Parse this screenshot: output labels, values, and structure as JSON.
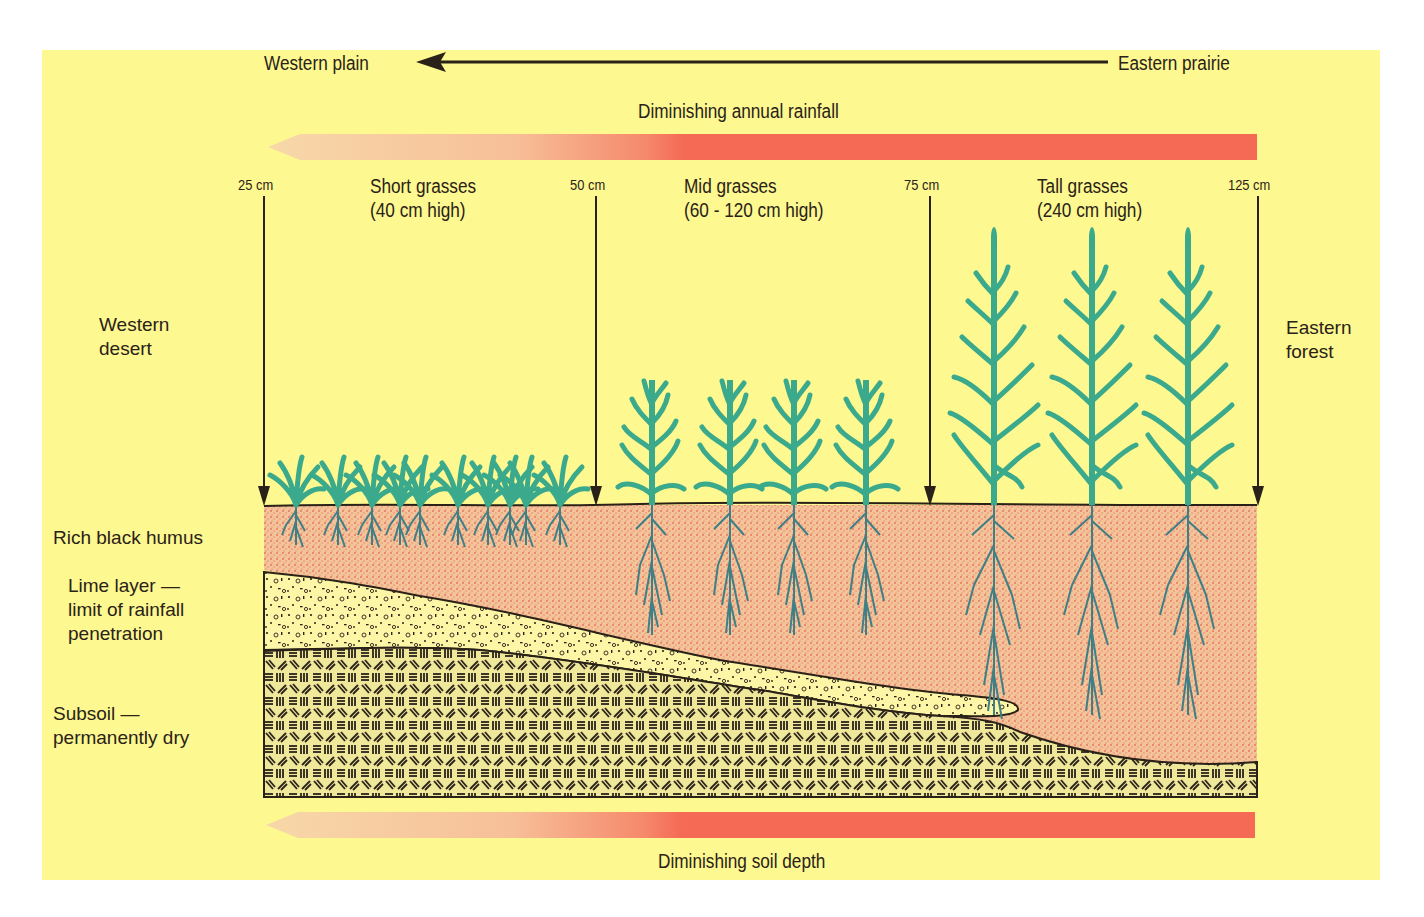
{
  "diagram": {
    "direction_arrow": {
      "left_label": "Western plain",
      "right_label": "Eastern prairie",
      "icon": "arrow-left-icon"
    },
    "rainfall_bar": {
      "label": "Diminishing annual rainfall",
      "color_full": "#f56a55",
      "color_faded": "#f7c9a0"
    },
    "soil_depth_bar": {
      "label": "Diminishing soil depth",
      "color_full": "#f56a55",
      "color_faded": "#f7c9a0"
    },
    "rainfall_markers": [
      {
        "label": "25 cm"
      },
      {
        "label": "50 cm"
      },
      {
        "label": "75 cm"
      },
      {
        "label": "125 cm"
      }
    ],
    "grass_zones": [
      {
        "name": "Short grasses",
        "height": "(40 cm high)"
      },
      {
        "name": "Mid grasses",
        "height": "(60 - 120 cm high)"
      },
      {
        "name": "Tall grasses",
        "height": "(240 cm high)"
      }
    ],
    "side_labels": {
      "west": "Western\ndesert",
      "east": "Eastern\nforest"
    },
    "soil_layers": [
      {
        "label": "Rich black humus",
        "color": "#f2b088"
      },
      {
        "label": "Lime layer —\nlimit of rainfall\npenetration",
        "color": "#fdf6a6"
      },
      {
        "label": "Subsoil —\npermanently dry",
        "color": "#eee79a"
      }
    ],
    "colors": {
      "background": "#fdf890",
      "grass": "#3aa98c",
      "roots": "#3f7f86",
      "ink": "#2a2218"
    }
  }
}
